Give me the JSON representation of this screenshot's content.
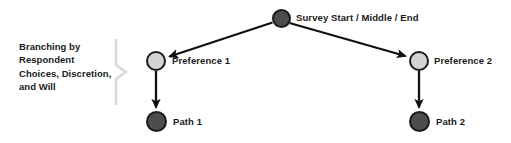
{
  "diagram": {
    "caption": "Branching by Respondent Choices, Discretion, and Will",
    "nodes": [
      {
        "id": "survey",
        "label": "Survey Start / Middle / End",
        "kind": "dark",
        "cx": 281,
        "cy": 18,
        "r": 9.5
      },
      {
        "id": "pref1",
        "label": "Preference 1",
        "kind": "light",
        "cx": 156,
        "cy": 61,
        "r": 10
      },
      {
        "id": "pref2",
        "label": "Preference 2",
        "kind": "light",
        "cx": 419,
        "cy": 61,
        "r": 10
      },
      {
        "id": "path1",
        "label": "Path 1",
        "kind": "dark",
        "cx": 156,
        "cy": 121,
        "r": 10.5
      },
      {
        "id": "path2",
        "label": "Path 2",
        "kind": "dark",
        "cx": 419,
        "cy": 121,
        "r": 10.5
      }
    ],
    "edges": [
      {
        "from": "survey",
        "to": "pref1"
      },
      {
        "from": "survey",
        "to": "pref2"
      },
      {
        "from": "pref1",
        "to": "path1"
      },
      {
        "from": "pref2",
        "to": "path2"
      }
    ],
    "colors": {
      "node_dark_fill": "#4d4d4d",
      "node_light_fill": "#d4d4d4",
      "node_stroke": "#1a1a1a",
      "edge": "#111111",
      "bracket": "#d9d9d9",
      "text": "#1a1a1a",
      "background": "#ffffff"
    }
  }
}
